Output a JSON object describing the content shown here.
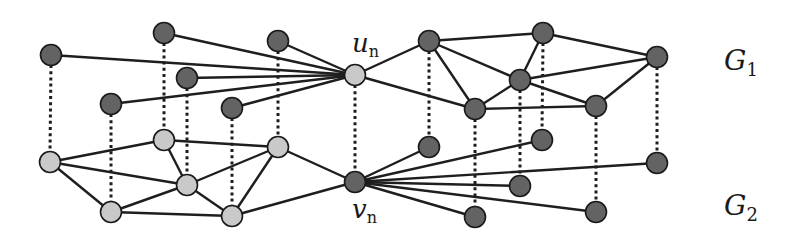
{
  "diagram": {
    "type": "graph-alignment",
    "colors": {
      "dark_node": "#636363",
      "light_node": "#c9c9c9",
      "edge": "#1e1e1e",
      "background": "#ffffff"
    },
    "labels": {
      "u_n": {
        "main": "u",
        "sub": "n",
        "x": 352,
        "y": 52
      },
      "v_n": {
        "main": "v",
        "sub": "n",
        "x": 352,
        "y": 218
      },
      "G1": {
        "main": "G",
        "sub": "1",
        "x": 724,
        "y": 70
      },
      "G2": {
        "main": "G",
        "sub": "2",
        "x": 724,
        "y": 215
      }
    },
    "graphs": [
      {
        "id": "G1",
        "nodes": [
          {
            "id": "a1",
            "x": 51,
            "y": 55,
            "shade": "dark"
          },
          {
            "id": "b1",
            "x": 164,
            "y": 33,
            "shade": "dark"
          },
          {
            "id": "c1",
            "x": 278,
            "y": 41,
            "shade": "dark"
          },
          {
            "id": "d1",
            "x": 187,
            "y": 78,
            "shade": "dark"
          },
          {
            "id": "e1",
            "x": 111,
            "y": 104,
            "shade": "dark"
          },
          {
            "id": "f1",
            "x": 232,
            "y": 108,
            "shade": "dark"
          },
          {
            "id": "u_n",
            "x": 355,
            "y": 75,
            "shade": "light"
          },
          {
            "id": "g1",
            "x": 429,
            "y": 41,
            "shade": "dark"
          },
          {
            "id": "h1",
            "x": 543,
            "y": 33,
            "shade": "dark"
          },
          {
            "id": "i1",
            "x": 657,
            "y": 57,
            "shade": "dark"
          },
          {
            "id": "j1",
            "x": 520,
            "y": 80,
            "shade": "dark"
          },
          {
            "id": "k1",
            "x": 475,
            "y": 109,
            "shade": "dark"
          },
          {
            "id": "l1",
            "x": 596,
            "y": 106,
            "shade": "dark"
          }
        ],
        "edges": [
          [
            "a1",
            "u_n"
          ],
          [
            "b1",
            "u_n"
          ],
          [
            "c1",
            "u_n"
          ],
          [
            "d1",
            "u_n"
          ],
          [
            "e1",
            "u_n"
          ],
          [
            "f1",
            "u_n"
          ],
          [
            "u_n",
            "g1"
          ],
          [
            "u_n",
            "k1"
          ],
          [
            "g1",
            "h1"
          ],
          [
            "g1",
            "j1"
          ],
          [
            "g1",
            "k1"
          ],
          [
            "h1",
            "j1"
          ],
          [
            "h1",
            "i1"
          ],
          [
            "j1",
            "i1"
          ],
          [
            "j1",
            "k1"
          ],
          [
            "j1",
            "l1"
          ],
          [
            "k1",
            "l1"
          ],
          [
            "l1",
            "i1"
          ]
        ]
      },
      {
        "id": "G2",
        "nodes": [
          {
            "id": "a2",
            "x": 50,
            "y": 162,
            "shade": "light"
          },
          {
            "id": "b2",
            "x": 164,
            "y": 140,
            "shade": "light"
          },
          {
            "id": "c2",
            "x": 278,
            "y": 147,
            "shade": "light"
          },
          {
            "id": "d2",
            "x": 187,
            "y": 185,
            "shade": "light"
          },
          {
            "id": "e2",
            "x": 111,
            "y": 212,
            "shade": "light"
          },
          {
            "id": "f2",
            "x": 232,
            "y": 216,
            "shade": "light"
          },
          {
            "id": "v_n",
            "x": 355,
            "y": 182,
            "shade": "dark"
          },
          {
            "id": "g2",
            "x": 429,
            "y": 147,
            "shade": "dark"
          },
          {
            "id": "h2",
            "x": 542,
            "y": 140,
            "shade": "dark"
          },
          {
            "id": "i2",
            "x": 657,
            "y": 163,
            "shade": "dark"
          },
          {
            "id": "j2",
            "x": 520,
            "y": 186,
            "shade": "dark"
          },
          {
            "id": "k2",
            "x": 475,
            "y": 217,
            "shade": "dark"
          },
          {
            "id": "l2",
            "x": 596,
            "y": 212,
            "shade": "dark"
          }
        ],
        "edges": [
          [
            "v_n",
            "g2"
          ],
          [
            "v_n",
            "h2"
          ],
          [
            "v_n",
            "i2"
          ],
          [
            "v_n",
            "j2"
          ],
          [
            "v_n",
            "k2"
          ],
          [
            "v_n",
            "l2"
          ],
          [
            "v_n",
            "c2"
          ],
          [
            "v_n",
            "f2"
          ],
          [
            "a2",
            "b2"
          ],
          [
            "a2",
            "d2"
          ],
          [
            "a2",
            "e2"
          ],
          [
            "b2",
            "c2"
          ],
          [
            "b2",
            "d2"
          ],
          [
            "d2",
            "c2"
          ],
          [
            "d2",
            "e2"
          ],
          [
            "d2",
            "f2"
          ],
          [
            "e2",
            "f2"
          ],
          [
            "f2",
            "c2"
          ]
        ]
      }
    ],
    "alignment_links": [
      [
        "a1",
        "a2"
      ],
      [
        "b1",
        "b2"
      ],
      [
        "c1",
        "c2"
      ],
      [
        "d1",
        "d2"
      ],
      [
        "e1",
        "e2"
      ],
      [
        "f1",
        "f2"
      ],
      [
        "u_n",
        "v_n"
      ],
      [
        "g1",
        "g2"
      ],
      [
        "h1",
        "h2"
      ],
      [
        "i1",
        "i2"
      ],
      [
        "j1",
        "j2"
      ],
      [
        "k1",
        "k2"
      ],
      [
        "l1",
        "l2"
      ]
    ]
  }
}
